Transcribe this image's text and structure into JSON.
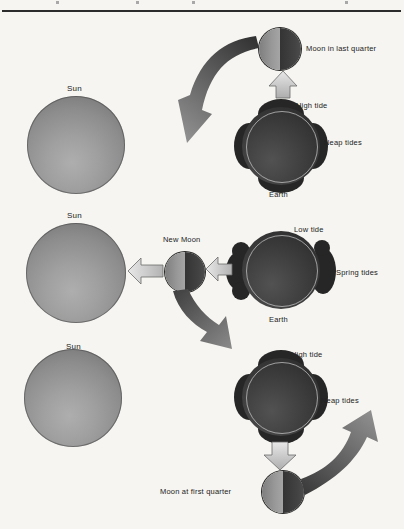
{
  "figure": {
    "panels": [
      {
        "sun_label": "Sun",
        "moon_label": "Moon in last quarter",
        "tide_label": "High tide",
        "tide_type_label": "Neap tides",
        "earth_label": "Earth"
      },
      {
        "sun_label": "Sun",
        "moon_label": "New Moon",
        "tide_label": "Low tide",
        "tide_type_label": "Spring tides",
        "earth_label": "Earth"
      },
      {
        "sun_label": "Sun",
        "moon_label": "Moon at first quarter",
        "tide_label": "High tide",
        "tide_type_label": "Neap tides"
      }
    ]
  },
  "colors": {
    "paper": "#f6f5f1",
    "rule": "#2c2c2c",
    "sun_gray": "#9a9a9a",
    "earth_dark": "#2d2d2d",
    "earth_ring": "#cdcdcd",
    "moon_lit": "#989898",
    "moon_shadow": "#3c3c3c",
    "block_arrow_fill": "#d9d9d9",
    "block_arrow_stroke": "#6a6a6a",
    "orbit_arrow_dark": "#3a3a3a",
    "orbit_arrow_light": "#8e8e8e"
  }
}
